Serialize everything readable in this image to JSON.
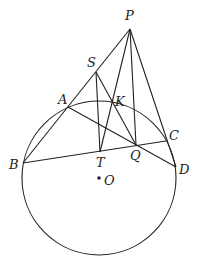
{
  "diagram": {
    "type": "geometry",
    "circle": {
      "center": "O",
      "cx": 99,
      "cy": 178,
      "r": 77
    },
    "points": {
      "P": {
        "x": 130,
        "y": 29,
        "label": "P",
        "lx": 125,
        "ly": 20
      },
      "S": {
        "x": 96,
        "y": 72,
        "label": "S",
        "lx": 87,
        "ly": 67
      },
      "A": {
        "x": 68,
        "y": 107,
        "label": "A",
        "lx": 58,
        "ly": 104
      },
      "K": {
        "x": 112,
        "y": 102,
        "label": "K",
        "lx": 115,
        "ly": 106
      },
      "B": {
        "x": 23,
        "y": 163,
        "label": "B",
        "lx": 9,
        "ly": 169
      },
      "T": {
        "x": 100,
        "y": 152,
        "label": "T",
        "lx": 96,
        "ly": 167
      },
      "Q": {
        "x": 136,
        "y": 145,
        "label": "Q",
        "lx": 130,
        "ly": 160
      },
      "C": {
        "x": 166,
        "y": 141,
        "label": "C",
        "lx": 169,
        "ly": 140
      },
      "D": {
        "x": 176,
        "y": 167,
        "label": "D",
        "lx": 179,
        "ly": 174
      },
      "O": {
        "x": 99,
        "y": 178,
        "label": "O",
        "lx": 104,
        "ly": 185
      }
    },
    "segments": [
      [
        "P",
        "B"
      ],
      [
        "P",
        "T"
      ],
      [
        "P",
        "Q"
      ],
      [
        "P",
        "D"
      ],
      [
        "S",
        "T"
      ],
      [
        "S",
        "Q"
      ],
      [
        "A",
        "D"
      ],
      [
        "B",
        "C"
      ]
    ]
  }
}
